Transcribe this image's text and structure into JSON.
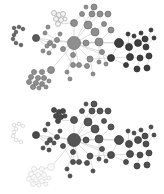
{
  "figure": {
    "type": "network-graph-comparison",
    "panels": [
      {
        "id": "top",
        "offset_y": 0,
        "styles": {
          "A": {
            "fill": "#8f8f8f",
            "stroke": "#6f6f6f"
          },
          "B": {
            "fill": "#5a5a5a",
            "stroke": "#3e3e3e"
          },
          "C": {
            "fill": "#3e3e3e",
            "stroke": "#2a2a2a"
          },
          "H": {
            "fill": "#f4f4f4",
            "stroke": "#a6a6a6"
          },
          "S": {
            "fill": "#6a6a6a",
            "stroke": "#4a4a4a"
          }
        }
      },
      {
        "id": "bottom",
        "offset_y": 97,
        "styles": {
          "A": {
            "fill": "#555555",
            "stroke": "#3a3a3a"
          },
          "B": {
            "fill": "#4a4a4a",
            "stroke": "#323232"
          },
          "C": {
            "fill": "#4e4e4e",
            "stroke": "#333333"
          },
          "H": {
            "fill": "#4a4a4a",
            "stroke": "#323232"
          },
          "S": {
            "fill": "#fafafa",
            "stroke": "#d2d2d2"
          },
          "T": {
            "fill": "#fafafa",
            "stroke": "#d8d8d8"
          }
        }
      }
    ],
    "edge_color": "#c8c8c8",
    "nodes": [
      {
        "id": "hub",
        "x": 74,
        "y": 43,
        "r": 6.5,
        "g": "A"
      },
      {
        "id": "n1",
        "x": 99,
        "y": 42,
        "r": 4,
        "g": "A"
      },
      {
        "id": "n2",
        "x": 88,
        "y": 25,
        "r": 4,
        "g": "A"
      },
      {
        "id": "n3",
        "x": 95,
        "y": 32,
        "r": 4,
        "g": "A"
      },
      {
        "id": "n4",
        "x": 74,
        "y": 23,
        "r": 3.5,
        "g": "A"
      },
      {
        "id": "n5",
        "x": 92,
        "y": 14,
        "r": 3,
        "g": "A"
      },
      {
        "id": "n6",
        "x": 100,
        "y": 14,
        "r": 3,
        "g": "A"
      },
      {
        "id": "n7",
        "x": 108,
        "y": 14,
        "r": 3,
        "g": "A"
      },
      {
        "id": "n8",
        "x": 82,
        "y": 14,
        "r": 2.5,
        "g": "A"
      },
      {
        "id": "n9",
        "x": 94,
        "y": 7,
        "r": 3,
        "g": "A"
      },
      {
        "id": "n10",
        "x": 86,
        "y": 43,
        "r": 3,
        "g": "A"
      },
      {
        "id": "n11",
        "x": 104,
        "y": 24,
        "r": 2.5,
        "g": "A"
      },
      {
        "id": "n12",
        "x": 111,
        "y": 30,
        "r": 3,
        "g": "A"
      },
      {
        "id": "n13",
        "x": 102,
        "y": 52,
        "r": 2.5,
        "g": "A"
      },
      {
        "id": "n14",
        "x": 90,
        "y": 59,
        "r": 3,
        "g": "A"
      },
      {
        "id": "n15",
        "x": 73,
        "y": 55,
        "r": 2.5,
        "g": "A"
      },
      {
        "id": "n16",
        "x": 63,
        "y": 49,
        "r": 2.5,
        "g": "A"
      },
      {
        "id": "n17",
        "x": 73,
        "y": 65,
        "r": 2.5,
        "g": "A"
      },
      {
        "id": "n18",
        "x": 79,
        "y": 65,
        "r": 2.5,
        "g": "A"
      },
      {
        "id": "n19",
        "x": 87,
        "y": 66,
        "r": 2.5,
        "g": "A"
      },
      {
        "id": "n20",
        "x": 99,
        "y": 62,
        "r": 2,
        "g": "A"
      },
      {
        "id": "n21",
        "x": 106,
        "y": 64,
        "r": 2,
        "g": "A"
      },
      {
        "id": "n22",
        "x": 93,
        "y": 74,
        "r": 2,
        "g": "A"
      },
      {
        "id": "n23",
        "x": 67,
        "y": 72,
        "r": 2,
        "g": "A"
      },
      {
        "id": "n24",
        "x": 70,
        "y": 79,
        "r": 2,
        "g": "A"
      },
      {
        "id": "n25",
        "x": 86,
        "y": 7,
        "r": 2,
        "g": "A"
      },
      {
        "id": "b1",
        "x": 119,
        "y": 43,
        "r": 4.5,
        "g": "C"
      },
      {
        "id": "b2",
        "x": 129,
        "y": 47,
        "r": 3.5,
        "g": "C"
      },
      {
        "id": "b3",
        "x": 138,
        "y": 43,
        "r": 3.5,
        "g": "C"
      },
      {
        "id": "b4",
        "x": 145,
        "y": 39,
        "r": 3,
        "g": "C"
      },
      {
        "id": "b5",
        "x": 146,
        "y": 47,
        "r": 3,
        "g": "C"
      },
      {
        "id": "b6",
        "x": 111,
        "y": 58,
        "r": 3.5,
        "g": "C"
      },
      {
        "id": "b7",
        "x": 130,
        "y": 57,
        "r": 3.5,
        "g": "C"
      },
      {
        "id": "b8",
        "x": 140,
        "y": 58,
        "r": 3,
        "g": "C"
      },
      {
        "id": "b9",
        "x": 149,
        "y": 56,
        "r": 3,
        "g": "C"
      },
      {
        "id": "b10",
        "x": 126,
        "y": 65,
        "r": 2.5,
        "g": "C"
      },
      {
        "id": "b11",
        "x": 137,
        "y": 69,
        "r": 3,
        "g": "C"
      },
      {
        "id": "b12",
        "x": 147,
        "y": 68,
        "r": 3,
        "g": "C"
      },
      {
        "id": "b13",
        "x": 128,
        "y": 34,
        "r": 2,
        "g": "C"
      },
      {
        "id": "b14",
        "x": 134,
        "y": 36,
        "r": 2,
        "g": "C"
      },
      {
        "id": "b15",
        "x": 141,
        "y": 33,
        "r": 2,
        "g": "C"
      },
      {
        "id": "b16",
        "x": 151,
        "y": 30,
        "r": 2,
        "g": "C"
      },
      {
        "id": "b17",
        "x": 154,
        "y": 38,
        "r": 2,
        "g": "C"
      },
      {
        "id": "l1",
        "x": 36,
        "y": 38,
        "r": 3.5,
        "g": "B"
      },
      {
        "id": "l2",
        "x": 45,
        "y": 33,
        "r": 2,
        "g": "A"
      },
      {
        "id": "l3",
        "x": 50,
        "y": 43,
        "r": 2.5,
        "g": "A"
      },
      {
        "id": "l4",
        "x": 54,
        "y": 46,
        "r": 2,
        "g": "A"
      },
      {
        "id": "l5",
        "x": 47,
        "y": 46,
        "r": 2,
        "g": "A"
      },
      {
        "id": "l6",
        "x": 57,
        "y": 40,
        "r": 2.5,
        "g": "A"
      },
      {
        "id": "l7",
        "x": 43,
        "y": 51,
        "r": 2,
        "g": "A"
      },
      {
        "id": "l8",
        "x": 49,
        "y": 53,
        "r": 2,
        "g": "A"
      },
      {
        "id": "l9",
        "x": 60,
        "y": 34,
        "r": 2,
        "g": "A"
      },
      {
        "id": "l10",
        "x": 48,
        "y": 27,
        "r": 2,
        "g": "A"
      },
      {
        "id": "c1",
        "x": 14,
        "y": 28,
        "r": 1.8,
        "g": "S"
      },
      {
        "id": "c2",
        "x": 19,
        "y": 27,
        "r": 1.8,
        "g": "S"
      },
      {
        "id": "c3",
        "x": 23,
        "y": 29,
        "r": 1.8,
        "g": "S"
      },
      {
        "id": "c4",
        "x": 16,
        "y": 32,
        "r": 1.8,
        "g": "S"
      },
      {
        "id": "c5",
        "x": 14,
        "y": 35,
        "r": 1.8,
        "g": "S"
      },
      {
        "id": "c6",
        "x": 13,
        "y": 39,
        "r": 1.8,
        "g": "S"
      },
      {
        "id": "c7",
        "x": 16,
        "y": 43,
        "r": 1.8,
        "g": "S"
      },
      {
        "id": "c8",
        "x": 21,
        "y": 45,
        "r": 1.8,
        "g": "S"
      },
      {
        "id": "h1",
        "x": 54,
        "y": 13,
        "r": 2.5,
        "g": "H"
      },
      {
        "id": "h2",
        "x": 59,
        "y": 15,
        "r": 2.5,
        "g": "H"
      },
      {
        "id": "h3",
        "x": 63,
        "y": 14,
        "r": 2.5,
        "g": "H"
      },
      {
        "id": "h4",
        "x": 56,
        "y": 19,
        "r": 2.5,
        "g": "H"
      },
      {
        "id": "h5",
        "x": 61,
        "y": 20,
        "r": 2.5,
        "g": "H"
      },
      {
        "id": "h6",
        "x": 58,
        "y": 24,
        "r": 2.5,
        "g": "H"
      },
      {
        "id": "h7",
        "x": 65,
        "y": 19,
        "r": 2,
        "g": "H"
      },
      {
        "id": "g1",
        "x": 51,
        "y": 70,
        "r": 3.5,
        "g": "T"
      },
      {
        "id": "g2",
        "x": 34,
        "y": 72,
        "r": 2.5,
        "g": "T"
      },
      {
        "id": "g3",
        "x": 42,
        "y": 72,
        "r": 2.5,
        "g": "T"
      },
      {
        "id": "g4",
        "x": 31,
        "y": 77,
        "r": 2.5,
        "g": "T"
      },
      {
        "id": "g5",
        "x": 38,
        "y": 78,
        "r": 2.5,
        "g": "T"
      },
      {
        "id": "g6",
        "x": 44,
        "y": 78,
        "r": 2.5,
        "g": "T"
      },
      {
        "id": "g7",
        "x": 29,
        "y": 82,
        "r": 2.5,
        "g": "T"
      },
      {
        "id": "g8",
        "x": 36,
        "y": 83,
        "r": 2.5,
        "g": "T"
      },
      {
        "id": "g9",
        "x": 42,
        "y": 84,
        "r": 2.5,
        "g": "T"
      },
      {
        "id": "g10",
        "x": 33,
        "y": 87,
        "r": 2.5,
        "g": "T"
      },
      {
        "id": "g11",
        "x": 39,
        "y": 88,
        "r": 2,
        "g": "T"
      },
      {
        "id": "g12",
        "x": 49,
        "y": 81,
        "r": 2,
        "g": "T"
      },
      {
        "id": "g13",
        "x": 46,
        "y": 87,
        "r": 2,
        "g": "T"
      }
    ],
    "edges": [
      [
        "hub",
        "n1"
      ],
      [
        "hub",
        "n2"
      ],
      [
        "hub",
        "n3"
      ],
      [
        "hub",
        "n4"
      ],
      [
        "hub",
        "n10"
      ],
      [
        "hub",
        "n14"
      ],
      [
        "hub",
        "n15"
      ],
      [
        "hub",
        "n16"
      ],
      [
        "hub",
        "b1"
      ],
      [
        "hub",
        "b6"
      ],
      [
        "hub",
        "l1"
      ],
      [
        "hub",
        "l6"
      ],
      [
        "hub",
        "g1"
      ],
      [
        "hub",
        "n9"
      ],
      [
        "hub",
        "n13"
      ],
      [
        "hub",
        "n17"
      ],
      [
        "n2",
        "n5"
      ],
      [
        "n2",
        "n6"
      ],
      [
        "n2",
        "n3"
      ],
      [
        "n3",
        "n1"
      ],
      [
        "n3",
        "n11"
      ],
      [
        "n4",
        "n8"
      ],
      [
        "n2",
        "n8"
      ],
      [
        "n5",
        "n9"
      ],
      [
        "n6",
        "n7"
      ],
      [
        "n1",
        "b1"
      ],
      [
        "n1",
        "n12"
      ],
      [
        "n1",
        "n13"
      ],
      [
        "n1",
        "n20"
      ],
      [
        "n10",
        "n1"
      ],
      [
        "b1",
        "b2"
      ],
      [
        "b1",
        "b3"
      ],
      [
        "b1",
        "b6"
      ],
      [
        "b2",
        "b7"
      ],
      [
        "b3",
        "b4"
      ],
      [
        "b3",
        "b5"
      ],
      [
        "b2",
        "b13"
      ],
      [
        "b3",
        "b14"
      ],
      [
        "b4",
        "b15"
      ],
      [
        "b5",
        "b16"
      ],
      [
        "b5",
        "b17"
      ],
      [
        "b6",
        "b7"
      ],
      [
        "b7",
        "b8"
      ],
      [
        "b8",
        "b9"
      ],
      [
        "b7",
        "b10"
      ],
      [
        "b8",
        "b11"
      ],
      [
        "b9",
        "b12"
      ],
      [
        "b6",
        "b10"
      ],
      [
        "n14",
        "b6"
      ],
      [
        "l1",
        "l3"
      ],
      [
        "l1",
        "l5"
      ],
      [
        "l3",
        "l4"
      ],
      [
        "l3",
        "l6"
      ],
      [
        "l2",
        "l6"
      ],
      [
        "l5",
        "l7"
      ],
      [
        "l4",
        "l8"
      ],
      [
        "l9",
        "l6"
      ],
      [
        "l10",
        "l2"
      ],
      [
        "c1",
        "c2"
      ],
      [
        "c2",
        "c3"
      ],
      [
        "c1",
        "c4"
      ],
      [
        "c4",
        "c5"
      ],
      [
        "c5",
        "c6"
      ],
      [
        "c6",
        "c7"
      ],
      [
        "c7",
        "c8"
      ],
      [
        "h1",
        "h2"
      ],
      [
        "h2",
        "h3"
      ],
      [
        "h1",
        "h4"
      ],
      [
        "h4",
        "h5"
      ],
      [
        "h5",
        "h6"
      ],
      [
        "h3",
        "h7"
      ],
      [
        "h5",
        "h7"
      ],
      [
        "h6",
        "n4"
      ],
      [
        "g1",
        "g3"
      ],
      [
        "g2",
        "g3"
      ],
      [
        "g3",
        "g6"
      ],
      [
        "g2",
        "g4"
      ],
      [
        "g4",
        "g5"
      ],
      [
        "g5",
        "g6"
      ],
      [
        "g4",
        "g7"
      ],
      [
        "g7",
        "g8"
      ],
      [
        "g8",
        "g9"
      ],
      [
        "g8",
        "g10"
      ],
      [
        "g10",
        "g11"
      ],
      [
        "g9",
        "g12"
      ],
      [
        "g9",
        "g13"
      ],
      [
        "n15",
        "n23"
      ],
      [
        "n16",
        "n17"
      ],
      [
        "n18",
        "n19"
      ],
      [
        "n14",
        "n19"
      ],
      [
        "n14",
        "n22"
      ],
      [
        "n23",
        "n24"
      ],
      [
        "n18",
        "hub"
      ],
      [
        "n21",
        "n13"
      ]
    ]
  }
}
